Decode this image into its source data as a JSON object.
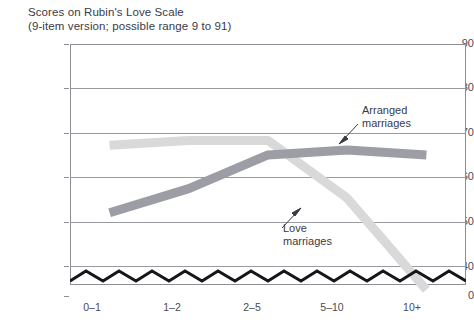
{
  "chart_data": {
    "type": "line",
    "title": "Scores on Rubin's Love Scale",
    "subtitle": "(9-item version; possible range 9 to 91)",
    "xlabel": "",
    "ylabel": "",
    "categories": [
      "0–1",
      "1–2",
      "2–5",
      "5–10",
      "10+"
    ],
    "yticks": [
      "90",
      "80",
      "70",
      "60",
      "50",
      "40",
      "0"
    ],
    "ytick_values": [
      90,
      80,
      70,
      60,
      50,
      40,
      0
    ],
    "ylim": [
      40,
      90
    ],
    "axis_break": true,
    "axis_break_style": "zigzag",
    "grid": true,
    "legend": "annotations",
    "series": [
      {
        "name": "Love marriages",
        "color": "#d9d9d9",
        "values": [
          69,
          70,
          70,
          58,
          39
        ]
      },
      {
        "name": "Arranged marriages",
        "color": "#9d9da5",
        "values": [
          55,
          60,
          67,
          68,
          67
        ]
      }
    ],
    "annotations": [
      {
        "id": "arranged",
        "text_line1": "Arranged",
        "text_line2": "marriages",
        "target_series": "Arranged marriages"
      },
      {
        "id": "love",
        "text_line1": "Love",
        "text_line2": "marriages",
        "target_series": "Love marriages"
      }
    ]
  },
  "yaxis": {
    "t90": "90",
    "t80": "80",
    "t70": "70",
    "t60": "60",
    "t50": "50",
    "t40": "40",
    "t0": "0"
  },
  "xaxis": {
    "c0": "0–1",
    "c1": "1–2",
    "c2": "2–5",
    "c3": "5–10",
    "c4": "10+"
  },
  "annotations": {
    "arranged_l1": "Arranged",
    "arranged_l2": "marriages",
    "love_l1": "Love",
    "love_l2": "marriages"
  },
  "colors": {
    "love_marriages": "#d9d9d9",
    "arranged_marriages": "#9d9da5",
    "grid": "#9a9aa2",
    "text": "#3a3a44"
  }
}
